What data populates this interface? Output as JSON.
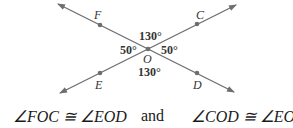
{
  "diagram": {
    "points": {
      "F": {
        "label": "F",
        "x": 100,
        "y": 25
      },
      "C": {
        "label": "C",
        "x": 197,
        "y": 24
      },
      "O": {
        "label": "O",
        "x": 148,
        "y": 49
      },
      "E": {
        "label": "E",
        "x": 100,
        "y": 73
      },
      "D": {
        "label": "D",
        "x": 197,
        "y": 73
      }
    },
    "angles": {
      "top": "130°",
      "bottom": "130°",
      "left": "50°",
      "right": "50°"
    },
    "line_color": "#6e6e6e",
    "point_color": "#6e6e6e"
  },
  "caption": {
    "left": "∠FOC ≅ ∠EOD",
    "middle": "and",
    "right": "∠COD ≅ ∠EOF"
  }
}
